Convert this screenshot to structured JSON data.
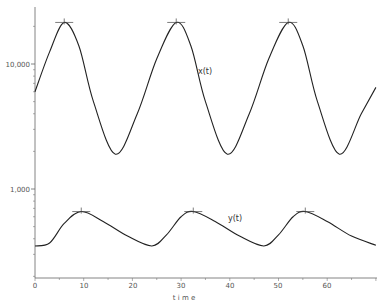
{
  "chart_data": {
    "type": "line",
    "title": "",
    "xlabel": "t i m e",
    "ylabel": "",
    "yscale": "log",
    "xlim": [
      0,
      70
    ],
    "ylim": [
      200,
      28000
    ],
    "x_ticks": [
      "0",
      "10",
      "20",
      "30",
      "40",
      "50",
      "60"
    ],
    "y_ticks": [
      "1,000",
      "10,000"
    ],
    "grid": false,
    "legend": "inline labels",
    "series": [
      {
        "name": "x(t)",
        "x": [
          0,
          3,
          6,
          9,
          12,
          16.5,
          21,
          25,
          29,
          32,
          35,
          39.5,
          44,
          48,
          52,
          55,
          58,
          62.5,
          67,
          70
        ],
        "values": [
          6000,
          12500,
          21500,
          14000,
          5000,
          1900,
          4000,
          11000,
          21500,
          14000,
          5000,
          1900,
          4000,
          11000,
          21500,
          14000,
          5000,
          1900,
          4000,
          6500
        ],
        "peak_markers": [
          6,
          29,
          52
        ]
      },
      {
        "name": "y(t)",
        "x": [
          0,
          3,
          6,
          9.5,
          14,
          19,
          24,
          27,
          30,
          32.5,
          37,
          42,
          47,
          50,
          53,
          55.5,
          60,
          65,
          70
        ],
        "values": [
          350,
          370,
          530,
          660,
          550,
          420,
          350,
          430,
          600,
          660,
          550,
          420,
          350,
          430,
          600,
          660,
          550,
          420,
          355
        ],
        "peak_markers": [
          9.5,
          32.5,
          55.5
        ]
      }
    ],
    "annotations": [
      {
        "text": "x(t)",
        "at": [
          34,
          11000
        ]
      },
      {
        "text": "y(t)",
        "at": [
          40,
          600
        ]
      }
    ]
  },
  "labels": {
    "y_1000": "1,000",
    "y_10000": "10,000",
    "x0": "0",
    "x10": "10",
    "x20": "20",
    "x30": "30",
    "x40": "40",
    "x50": "50",
    "x60": "60",
    "xlabel": "t i m e",
    "series_x": "x(t)",
    "series_y": "y(t)"
  }
}
